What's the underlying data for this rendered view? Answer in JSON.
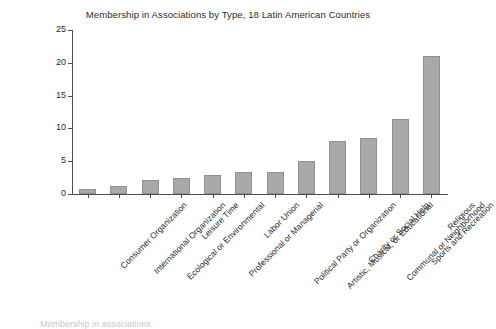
{
  "chart_data": {
    "type": "bar",
    "title": "Membership in Associations by Type, 18 Latin American Countries",
    "xlabel": "",
    "ylabel": "",
    "ylim": [
      0,
      25
    ],
    "yticks": [
      0,
      5,
      10,
      15,
      20,
      25
    ],
    "grid": false,
    "legend": null,
    "bar_color": "#a9a9a9",
    "bar_edge_color": "#8f8f8f",
    "categories": [
      "Consumer Organization",
      "International Organization",
      "Ecological or Environmental",
      "Leisure Time",
      "Professional or Managerial",
      "Labor Union",
      "Political Party or Organization",
      "Artistic, Musical, or Educational",
      "Charity or Social Help",
      "Communal or Neighborhood",
      "Sports and Recreation",
      "Religious"
    ],
    "values": [
      0.7,
      1.2,
      2.2,
      2.5,
      2.9,
      3.3,
      3.4,
      5.0,
      8.1,
      8.5,
      11.4,
      21.0
    ]
  },
  "caption": {
    "text": "Membership in associations"
  }
}
